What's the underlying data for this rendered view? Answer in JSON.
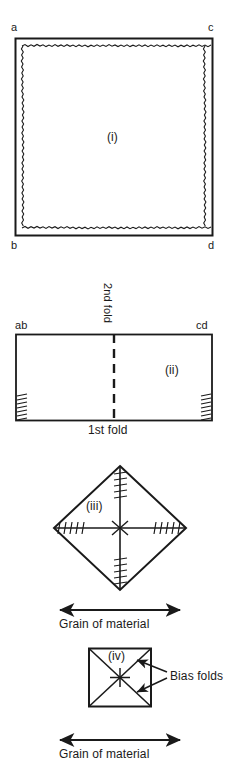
{
  "document": {
    "title": "Folding fabric to find the bias - four stage diagram",
    "ink_color": "#1a1a1a",
    "background_color": "#ffffff"
  },
  "figures": [
    {
      "id": "figure-i",
      "caption": "(i)",
      "shape": "square-of-fabric-with-frayed-edges",
      "corner_labels": {
        "top_left": "a",
        "top_right": "c",
        "bottom_left": "b",
        "bottom_right": "d"
      }
    },
    {
      "id": "figure-ii",
      "caption": "(ii)",
      "shape": "rectangle-folded-once",
      "corner_labels": {
        "top_left": "ab",
        "top_right": "cd"
      },
      "fold_labels": {
        "vertical": "2nd fold",
        "horizontal": "1st fold"
      }
    },
    {
      "id": "figure-iii",
      "caption": "(iii)",
      "shape": "diamond-opened-out",
      "grain_label": "Grain of material"
    },
    {
      "id": "figure-iv",
      "caption": "(iv)",
      "shape": "square-with-bias-diagonals",
      "annotation_label": "Bias folds",
      "grain_label": "Grain of material"
    }
  ]
}
